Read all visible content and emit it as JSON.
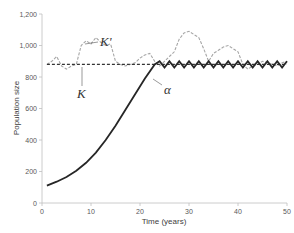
{
  "chart_data": {
    "type": "line",
    "title": "",
    "xlabel": "Time (years)",
    "ylabel": "Population size",
    "xlim": [
      0,
      50
    ],
    "ylim": [
      0,
      1200
    ],
    "x_ticks": [
      "0",
      "10",
      "20",
      "30",
      "40",
      "50"
    ],
    "y_ticks": [
      "0",
      "200",
      "400",
      "600",
      "800",
      "1,000",
      "1,200"
    ],
    "grid": false,
    "legend": "none (inline annotations)",
    "series": [
      {
        "name": "K",
        "style": "black dashed",
        "x": [
          1,
          50
        ],
        "y": [
          880,
          880
        ]
      },
      {
        "name": "K'",
        "style": "gray dashed",
        "x": [
          1,
          2,
          3,
          4,
          5,
          6,
          7,
          8,
          9,
          10,
          11,
          12,
          13,
          14,
          15,
          16,
          17,
          18,
          19,
          20,
          21,
          22,
          23,
          24,
          25,
          26,
          27,
          28,
          29,
          30,
          31,
          32,
          33,
          34,
          35,
          36,
          37,
          38,
          39,
          40,
          41,
          42,
          43,
          44,
          45,
          46,
          47,
          48,
          49,
          50
        ],
        "y": [
          880,
          900,
          930,
          870,
          850,
          870,
          880,
          1000,
          1030,
          1010,
          1050,
          1020,
          1000,
          1010,
          900,
          880,
          870,
          880,
          890,
          920,
          940,
          950,
          900,
          870,
          900,
          930,
          960,
          1040,
          1080,
          1090,
          1070,
          1050,
          980,
          900,
          950,
          970,
          990,
          1000,
          980,
          960,
          880,
          850,
          870,
          880,
          900,
          890,
          880,
          870,
          890,
          900
        ]
      },
      {
        "name": "α",
        "style": "black solid",
        "x": [
          1,
          3,
          5,
          7,
          9,
          11,
          13,
          15,
          17,
          19,
          21,
          23,
          24,
          25,
          26,
          27,
          28,
          29,
          30,
          31,
          32,
          33,
          34,
          35,
          36,
          37,
          38,
          39,
          40,
          41,
          42,
          43,
          44,
          45,
          46,
          47,
          48,
          49,
          50
        ],
        "y": [
          110,
          135,
          165,
          205,
          255,
          320,
          400,
          490,
          590,
          690,
          790,
          880,
          900,
          860,
          900,
          860,
          900,
          860,
          900,
          860,
          900,
          860,
          900,
          860,
          900,
          860,
          900,
          860,
          900,
          860,
          900,
          860,
          900,
          860,
          900,
          860,
          900,
          860,
          900
        ]
      }
    ],
    "annotations": [
      {
        "text": "K'",
        "x": 16,
        "y": 1010
      },
      {
        "text": "K",
        "x": 9,
        "y": 780
      },
      {
        "text": "α",
        "x": 25.5,
        "y": 770
      }
    ]
  },
  "labels": {
    "xlabel": "Time (years)",
    "ylabel": "Population size",
    "ann_kprime": "K'",
    "ann_k": "K",
    "ann_alpha": "α"
  },
  "colors": {
    "axis": "#bfbfbf",
    "alpha_line": "#262626",
    "k_line": "#333333",
    "kprime_line": "#a6a6a6"
  }
}
